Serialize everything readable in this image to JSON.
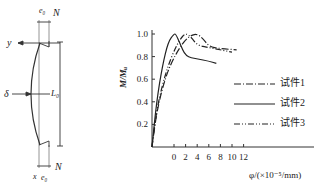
{
  "diagram": {
    "labels": {
      "e0_top": "e₀",
      "N_top": "N",
      "y_axis": "y",
      "delta": "δ",
      "L0": "L₀",
      "x_axis": "x",
      "e0_bottom": "e₀",
      "N_bottom": "N"
    }
  },
  "chart_data": {
    "type": "line",
    "title": "",
    "xlabel": "φ/(×10⁻⁵/mm)",
    "ylabel": "M/Mᵤ",
    "x_ticks": [
      "0",
      "2",
      "4",
      "6",
      "8",
      "10",
      "12"
    ],
    "y_ticks": [
      "0.2",
      "0.4",
      "0.6",
      "0.8",
      "1.0"
    ],
    "xlim": [
      -3.8,
      12
    ],
    "ylim": [
      0,
      1.05
    ],
    "grid": false,
    "legend_position": "right-center",
    "series": [
      {
        "name": "试件1",
        "style": "dash-dot",
        "x": [
          -3.8,
          -3.0,
          -2.0,
          -1.0,
          0.0,
          1.0,
          2.0,
          3.0,
          4.0,
          5.0,
          6.0,
          8.0,
          10.8
        ],
        "y": [
          0.0,
          0.3,
          0.52,
          0.68,
          0.79,
          0.88,
          0.95,
          0.99,
          1.0,
          0.96,
          0.89,
          0.87,
          0.86
        ]
      },
      {
        "name": "试件2",
        "style": "solid",
        "x": [
          -3.8,
          -3.0,
          -2.0,
          -1.0,
          0.0,
          0.3,
          1.0,
          2.0,
          4.0,
          6.0,
          7.3
        ],
        "y": [
          0.0,
          0.4,
          0.72,
          0.93,
          1.0,
          1.0,
          0.92,
          0.8,
          0.78,
          0.76,
          0.74
        ]
      },
      {
        "name": "试件3",
        "style": "dash-dot-dot",
        "x": [
          -3.8,
          -3.0,
          -2.0,
          -1.0,
          0.0,
          1.0,
          2.0,
          3.0,
          4.0,
          6.0,
          8.0,
          10.0
        ],
        "y": [
          0.0,
          0.32,
          0.55,
          0.72,
          0.85,
          0.95,
          1.01,
          0.97,
          0.9,
          0.88,
          0.86,
          0.84
        ]
      }
    ]
  },
  "legend": [
    {
      "label": "试件1",
      "style": "dash-dot"
    },
    {
      "label": "试件2",
      "style": "solid"
    },
    {
      "label": "试件3",
      "style": "dash-dot-dot"
    }
  ]
}
